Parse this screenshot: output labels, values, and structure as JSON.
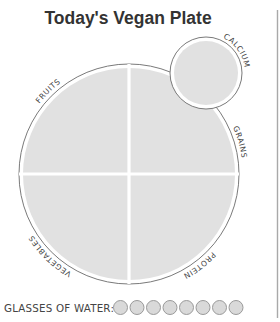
{
  "title": "Today's Vegan Plate",
  "plate": {
    "sections": [
      {
        "id": "fruits",
        "label": "FRUITS"
      },
      {
        "id": "grains",
        "label": "GRAINS"
      },
      {
        "id": "protein",
        "label": "PROTEIN"
      },
      {
        "id": "vegetables",
        "label": "VEGETABLES"
      }
    ],
    "side_dish": {
      "id": "calcium",
      "label": "CALCIUM"
    }
  },
  "water": {
    "label": "GLASSES OF WATER:",
    "glass_count": 8
  },
  "colors": {
    "section_fill": "#e1e1e1",
    "outline": "#7a7a7a",
    "text": "#333333"
  }
}
